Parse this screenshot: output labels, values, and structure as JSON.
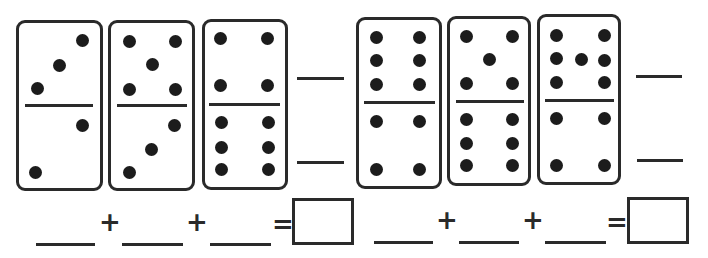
{
  "worksheet": {
    "groups": [
      {
        "dominoes": [
          {
            "top": 3,
            "bottom": 2
          },
          {
            "top": 5,
            "bottom": 3
          },
          {
            "top": 4,
            "bottom": 6
          }
        ],
        "blank_lines": 2,
        "equation": {
          "operators": [
            "+",
            "+",
            "="
          ],
          "blanks": 3,
          "answer_box": ""
        }
      },
      {
        "dominoes": [
          {
            "top": 6,
            "bottom": 4
          },
          {
            "top": 5,
            "bottom": 6
          },
          {
            "top": 7,
            "bottom": 4
          }
        ],
        "blank_lines": 2,
        "equation": {
          "operators": [
            "+",
            "+",
            "="
          ],
          "blanks": 3,
          "answer_box": ""
        }
      }
    ]
  },
  "labels": {
    "plus": "+",
    "equals": "="
  },
  "colors": {
    "ink": "#2a2a2a",
    "pip": "#1c1c1c",
    "paper": "#ffffff"
  }
}
